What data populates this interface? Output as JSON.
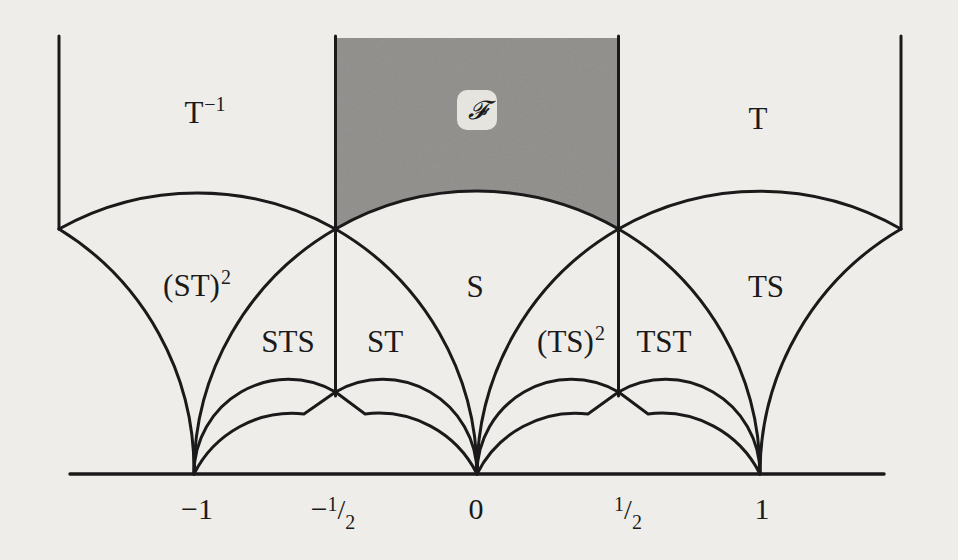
{
  "figure": {
    "colors": {
      "background": "#eeede9",
      "fundamental_domain_fill": "#8e8d8a",
      "line": "#1a1a1a"
    },
    "fundamental_domain_label": "𝓕",
    "region_labels": [
      {
        "id": "t-inverse",
        "base": "T",
        "sup": "−1"
      },
      {
        "id": "t",
        "base": "T",
        "sup": ""
      },
      {
        "id": "st-squared",
        "base": "(ST)",
        "sup": "2"
      },
      {
        "id": "s",
        "base": "S",
        "sup": ""
      },
      {
        "id": "ts",
        "base": "TS",
        "sup": ""
      },
      {
        "id": "sts",
        "base": "STS",
        "sup": ""
      },
      {
        "id": "st",
        "base": "ST",
        "sup": ""
      },
      {
        "id": "ts-squared",
        "base": "(TS)",
        "sup": "2"
      },
      {
        "id": "tst",
        "base": "TST",
        "sup": ""
      }
    ],
    "axis_ticks": [
      {
        "id": "minus-one",
        "text": "−1"
      },
      {
        "id": "minus-half",
        "sign": "−",
        "num": "1",
        "den": "2"
      },
      {
        "id": "zero",
        "text": "0"
      },
      {
        "id": "half",
        "sign": "",
        "num": "1",
        "den": "2"
      },
      {
        "id": "one",
        "text": "1"
      }
    ]
  }
}
